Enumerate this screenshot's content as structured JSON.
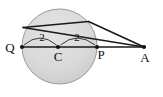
{
  "figure": {
    "background_color": "#ffffff",
    "stroke_color": "#1a1a1a",
    "circle_fill": "#d8d8d8",
    "label_color": "#111111"
  },
  "points": {
    "Q": {
      "label": "Q",
      "x": 22,
      "y": 47,
      "label_x": 10,
      "label_y": 52
    },
    "C": {
      "label": "C",
      "x": 58,
      "y": 47,
      "label_x": 58,
      "label_y": 60
    },
    "P": {
      "label": "P",
      "x": 97,
      "y": 47,
      "label_x": 101,
      "label_y": 59
    },
    "A": {
      "label": "A",
      "x": 144,
      "y": 47,
      "label_x": 144,
      "label_y": 61
    }
  },
  "circle": {
    "center_x": 59.5,
    "center_y": 46.5,
    "radius": 37.5
  },
  "measures": [
    {
      "name": "radius-QC",
      "label": "2",
      "x": 42,
      "y": 40
    },
    {
      "name": "radius-CP",
      "label": "2",
      "x": 77,
      "y": 40
    }
  ],
  "segments": [
    {
      "name": "diameter-QPA-line",
      "x1": 22,
      "y1": 47,
      "x2": 144,
      "y2": 47
    },
    {
      "name": "secant-upper-chord-to-A",
      "x1": 23,
      "y1": 27,
      "x2": 144,
      "y2": 47
    },
    {
      "name": "tangent-to-A",
      "x1": 90,
      "y1": 21,
      "x2": 144,
      "y2": 47
    }
  ],
  "arcs": [
    {
      "name": "arc-marker-left",
      "d": "M 24 44 Q 40 30 57 44"
    },
    {
      "name": "arc-marker-right",
      "d": "M 60 44 Q 77 30 95 44"
    }
  ]
}
